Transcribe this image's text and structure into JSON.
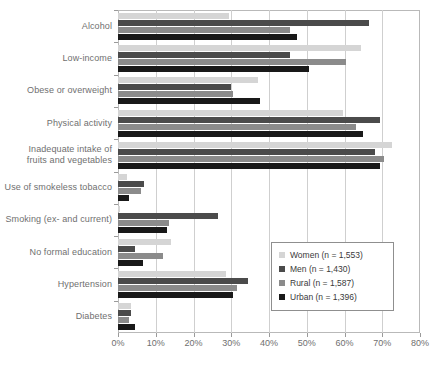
{
  "chart_data": {
    "type": "bar",
    "orientation": "horizontal",
    "title": "",
    "xlabel": "",
    "ylabel": "",
    "xlim": [
      0,
      80
    ],
    "xticks": [
      "0%",
      "10%",
      "20%",
      "30%",
      "40%",
      "50%",
      "60%",
      "70%",
      "80%"
    ],
    "xtick_values": [
      0,
      10,
      20,
      30,
      40,
      50,
      60,
      70,
      80
    ],
    "grid": "vertical",
    "legend_position": "inside-right",
    "categories": [
      "Alcohol",
      "Low-income",
      "Obese or overweight",
      "Physical activity",
      "Inadequate intake of fruits and vegetables",
      "Use of smokeless tobacco",
      "Smoking (ex- and current)",
      "No formal education",
      "Hypertension",
      "Diabetes"
    ],
    "series": [
      {
        "name": "Women (n = 1,553)",
        "color": "#d5d5d5",
        "values": [
          29.5,
          64.5,
          37.0,
          59.5,
          72.5,
          2.5,
          0.5,
          14.0,
          28.5,
          3.5
        ]
      },
      {
        "name": "Men (n = 1,430)",
        "color": "#4b4b4b",
        "values": [
          66.5,
          45.5,
          30.0,
          69.5,
          68.0,
          7.0,
          26.5,
          4.5,
          34.5,
          3.5
        ]
      },
      {
        "name": "Rural (n = 1,587)",
        "color": "#8b8b8b",
        "values": [
          45.5,
          60.5,
          30.5,
          63.0,
          70.5,
          6.0,
          13.5,
          12.0,
          31.5,
          3.0
        ]
      },
      {
        "name": "Urban (n = 1,396)",
        "color": "#191919",
        "values": [
          47.5,
          50.5,
          37.5,
          65.0,
          69.5,
          3.0,
          13.0,
          6.5,
          30.5,
          4.5
        ]
      }
    ]
  },
  "legend": {
    "entries": [
      {
        "label": "Women (n = 1,553)"
      },
      {
        "label": "Men (n = 1,430)"
      },
      {
        "label": "Rural (n = 1,587)"
      },
      {
        "label": "Urban (n = 1,396)"
      }
    ]
  }
}
